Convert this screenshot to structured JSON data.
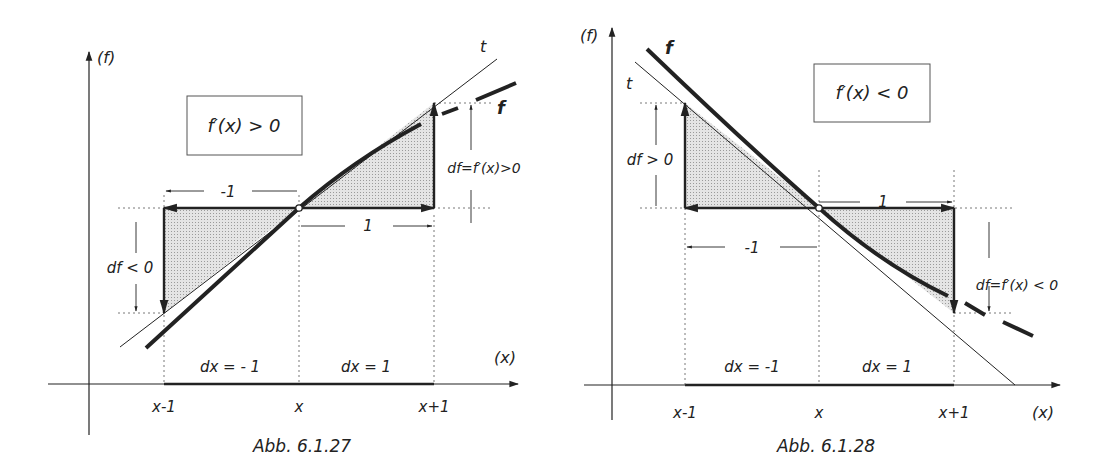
{
  "colors": {
    "ink": "#222222",
    "shade": "#cfcfcf",
    "dotted": "#555555"
  },
  "left": {
    "caption": "Abb. 6.1.27",
    "y_axis_label": "(f)",
    "x_axis_label": "(x)",
    "condition_box": "f′(x) > 0",
    "tangent_label": "t",
    "function_label": "f",
    "tick_labels": [
      "x-1",
      "x",
      "x+1"
    ],
    "dx_left": "dx = - 1",
    "dx_right": "dx = 1",
    "span_left": "-1",
    "span_right": "1",
    "df_left": "df < 0",
    "df_right": "df=f′(x)>0"
  },
  "right": {
    "caption": "Abb. 6.1.28",
    "y_axis_label": "(f)",
    "x_axis_label": "(x)",
    "condition_box": "f′(x) < 0",
    "tangent_label": "t",
    "function_label": "f",
    "tick_labels": [
      "x-1",
      "x",
      "x+1"
    ],
    "dx_left": "dx = -1",
    "dx_right": "dx = 1",
    "span_left": "-1",
    "span_right": "1",
    "df_left": "df > 0",
    "df_right": "df=f′(x) < 0"
  }
}
